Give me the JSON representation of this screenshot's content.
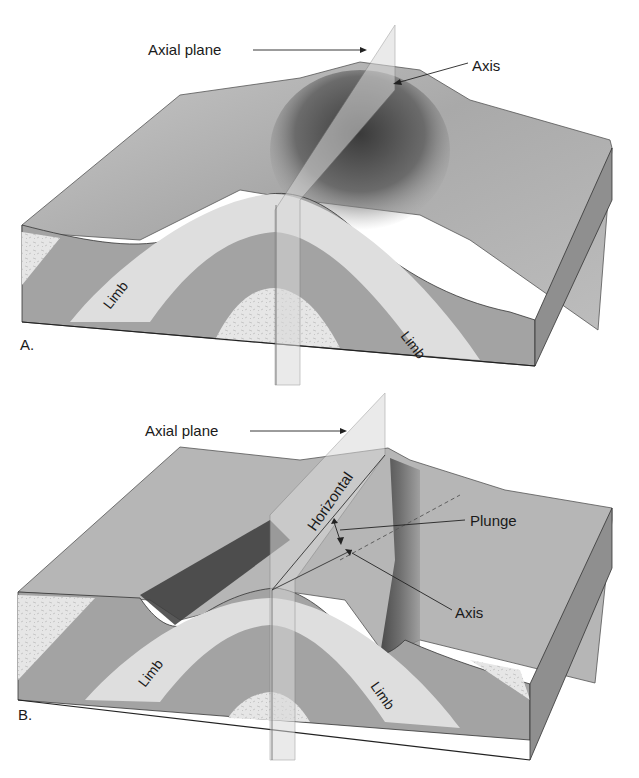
{
  "figure": {
    "panels": [
      {
        "id": "A",
        "panel_label": "A.",
        "labels": {
          "axial_plane": "Axial plane",
          "axis": "Axis",
          "limb_left": "Limb",
          "limb_right": "Limb"
        }
      },
      {
        "id": "B",
        "panel_label": "B.",
        "labels": {
          "axial_plane": "Axial plane",
          "horizontal": "Horizontal",
          "plunge": "Plunge",
          "axis": "Axis",
          "limb_left": "Limb",
          "limb_right": "Limb"
        }
      }
    ],
    "colors": {
      "background": "#ffffff",
      "ink": "#1a1a1a",
      "surface_light": "#b8b8b8",
      "surface_dark": "#4a4a4a",
      "layer_dark": "#a3a3a3",
      "layer_light": "#dedede",
      "side_face": "#8f8f8f",
      "plane_fill": "#d9d9d9"
    }
  }
}
